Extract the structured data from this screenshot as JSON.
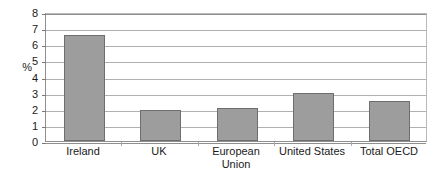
{
  "chart_data": {
    "type": "bar",
    "title": "",
    "subtitle": "",
    "xlabel": "",
    "ylabel": "%",
    "categories": [
      "Ireland",
      "UK",
      "European Union",
      "United States",
      "Total OECD"
    ],
    "category_lines": [
      [
        "Ireland"
      ],
      [
        "UK"
      ],
      [
        "European",
        "Union"
      ],
      [
        "United States"
      ],
      [
        "Total OECD"
      ]
    ],
    "values": [
      6.6,
      1.95,
      2.05,
      2.95,
      2.45
    ],
    "ylim": [
      0,
      8
    ],
    "ytick_labels": [
      "0",
      "1",
      "2",
      "3",
      "4",
      "5",
      "6",
      "7",
      "8"
    ],
    "ytick_values": [
      0,
      1,
      2,
      3,
      4,
      5,
      6,
      7,
      8
    ],
    "grid": true,
    "legend": false,
    "legend_position": "none",
    "series": [
      {
        "name": "",
        "values": [
          6.6,
          1.95,
          2.05,
          2.95,
          2.45
        ]
      }
    ],
    "colors": {
      "bar_fill": "#9d9d9d",
      "bar_border": "#6e6e6e",
      "gridline": "#b0b0b0",
      "axis": "#8f8f8f",
      "text": "#1a1a1a",
      "background": "#ffffff"
    }
  }
}
